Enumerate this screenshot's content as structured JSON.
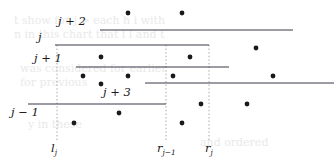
{
  "figure": {
    "width": 334,
    "height": 165,
    "background_color": "#ffffff",
    "line_color": "#3a3a4a",
    "dot_color": "#1a1a1a",
    "dotted_color": "#9a9a9a",
    "ghost_text_color": "#e9e9e9"
  },
  "chart_data": {
    "type": "scatter",
    "title": "",
    "xlabel": "",
    "ylabel": "",
    "xlim": [
      0,
      334
    ],
    "ylim": [
      0,
      165
    ],
    "grid": false,
    "legend": "none",
    "segments": [
      {
        "label": "j + 2",
        "x1": 100,
        "x2": 293,
        "y": 30,
        "label_x": 86,
        "label_y": 20,
        "label_anchor": "end"
      },
      {
        "label": "j",
        "x1": 55,
        "x2": 209,
        "y": 45,
        "label_x": 45,
        "label_y": 35,
        "label_anchor": "end"
      },
      {
        "label": "j + 1",
        "x1": 76,
        "x2": 229,
        "y": 67,
        "label_x": 62,
        "label_y": 57,
        "label_anchor": "end"
      },
      {
        "label": "",
        "x1": 145,
        "x2": 334,
        "y": 83,
        "label_x": 0,
        "label_y": 0,
        "label_anchor": "end"
      },
      {
        "label": "j + 3",
        "x1": 145,
        "x2": 334,
        "y": 83,
        "label_x": 131,
        "label_y": 88,
        "label_anchor": "end"
      },
      {
        "label": "j − 1",
        "x1": 28,
        "x2": 166,
        "y": 104,
        "label_x": 16,
        "label_y": 108,
        "label_anchor": "end"
      }
    ],
    "vertical_dotted_lines": [
      {
        "label": "l_j",
        "x": 57,
        "y1": 45,
        "y2": 140,
        "tick_label_x": 57,
        "tick_label_y": 144
      },
      {
        "label": "r_{j-1}",
        "x": 166,
        "y1": 45,
        "y2": 140,
        "tick_label_x": 166,
        "tick_label_y": 144
      },
      {
        "label": "r_j",
        "x": 209,
        "y1": 45,
        "y2": 140,
        "tick_label_x": 209,
        "tick_label_y": 144
      }
    ],
    "points": [
      {
        "x": 128,
        "y": 13
      },
      {
        "x": 182,
        "y": 13
      },
      {
        "x": 256,
        "y": 48
      },
      {
        "x": 101,
        "y": 57
      },
      {
        "x": 190,
        "y": 57
      },
      {
        "x": 83,
        "y": 76
      },
      {
        "x": 128,
        "y": 76
      },
      {
        "x": 173,
        "y": 76
      },
      {
        "x": 273,
        "y": 76
      },
      {
        "x": 101,
        "y": 84
      },
      {
        "x": 201,
        "y": 104
      },
      {
        "x": 247,
        "y": 104
      },
      {
        "x": 119,
        "y": 113
      },
      {
        "x": 74,
        "y": 123
      },
      {
        "x": 182,
        "y": 123
      }
    ],
    "point_radius": 2.4
  },
  "segment_labels": {
    "j_plus_2": "j + 2",
    "j": "j",
    "j_plus_1": "j + 1",
    "j_plus_3": "j + 3",
    "j_minus_1": "j − 1"
  },
  "tick_labels": {
    "l_j_base": "l",
    "l_j_sub": "j",
    "r_j_minus_1_base": "r",
    "r_j_minus_1_sub": "j−1",
    "r_j_base": "r",
    "r_j_sub": "j"
  },
  "background_bleed_text": {
    "line1": "t show   for j > each   h   i                 with",
    "line2": "n in this   chart that   l     l and   t",
    "line3": "was considered  for earlier",
    "line4": "for previous",
    "line5": "y   in these",
    "line6": "and ordered"
  }
}
